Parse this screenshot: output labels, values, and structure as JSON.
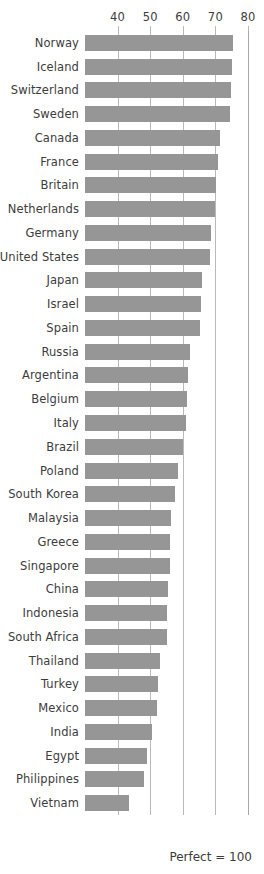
{
  "chart_data": {
    "type": "bar",
    "orientation": "horizontal",
    "title": "",
    "subtitle": "",
    "xlabel": "",
    "ylabel": "",
    "xlim": [
      30,
      80
    ],
    "ylim": null,
    "grid": true,
    "grid_axis": "x",
    "legend": null,
    "legend_position": "none",
    "bar_color": "#969696",
    "gridline_color": "#b9b9b9",
    "text_color": "#3c3c3c",
    "background_color": "#ffffff",
    "axis_position": "top",
    "tick_values": [
      40,
      50,
      60,
      70,
      80
    ],
    "tick_labels": [
      "40",
      "50",
      "60",
      "70",
      "80"
    ],
    "annotations": [
      "Perfect = 100"
    ],
    "categories": [
      "Norway",
      "Iceland",
      "Switzerland",
      "Sweden",
      "Canada",
      "France",
      "Britain",
      "Netherlands",
      "Germany",
      "United States",
      "Japan",
      "Israel",
      "Spain",
      "Russia",
      "Argentina",
      "Belgium",
      "Italy",
      "Brazil",
      "Poland",
      "South Korea",
      "Malaysia",
      "Greece",
      "Singapore",
      "China",
      "Indonesia",
      "South Africa",
      "Thailand",
      "Turkey",
      "Mexico",
      "India",
      "Egypt",
      "Philippines",
      "Vietnam"
    ],
    "values": [
      75.5,
      75.0,
      74.8,
      74.5,
      71.5,
      70.8,
      70.3,
      70.0,
      68.5,
      68.2,
      66.0,
      65.5,
      65.2,
      62.3,
      61.5,
      61.2,
      61.0,
      60.0,
      58.5,
      57.5,
      56.5,
      56.2,
      56.0,
      55.5,
      55.2,
      55.0,
      53.0,
      52.5,
      52.0,
      50.5,
      49.0,
      48.0,
      43.5
    ]
  },
  "axis": {
    "ticks": [
      {
        "label": "40",
        "value": 40
      },
      {
        "label": "50",
        "value": 50
      },
      {
        "label": "60",
        "value": 60
      },
      {
        "label": "70",
        "value": 70
      },
      {
        "label": "80",
        "value": 80
      }
    ]
  },
  "footer": {
    "note": "Perfect = 100"
  }
}
